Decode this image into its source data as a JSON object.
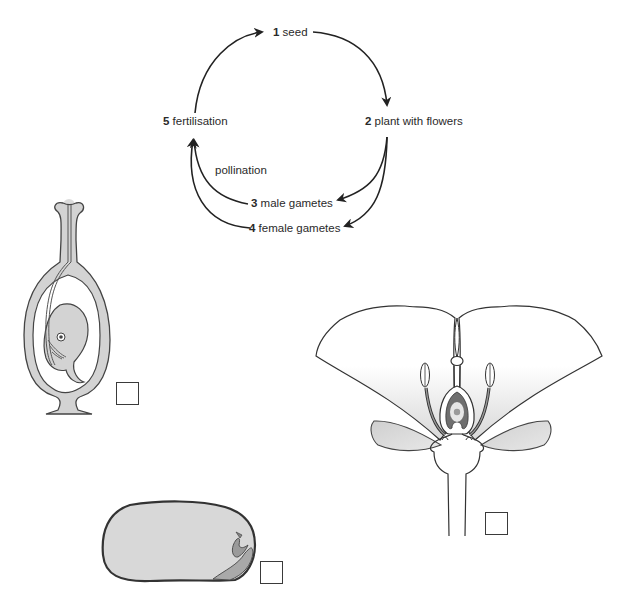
{
  "cycle": {
    "stages": [
      {
        "number": "1",
        "label": "seed"
      },
      {
        "number": "2",
        "label": "plant with flowers"
      },
      {
        "number": "3",
        "label": "male gametes"
      },
      {
        "number": "4",
        "label": "female gametes"
      },
      {
        "number": "5",
        "label": "fertilisation"
      }
    ],
    "arrow_labels": {
      "pollination": "pollination"
    }
  },
  "figures": [
    {
      "name": "pistil-ovary-section",
      "answer_box": ""
    },
    {
      "name": "flower-section",
      "answer_box": ""
    },
    {
      "name": "seed-section",
      "answer_box": ""
    }
  ],
  "colors": {
    "stroke": "#3a3a3a",
    "fill_grey": "#d6d6d6",
    "fill_light": "#e4e4e4",
    "background": "#ffffff"
  }
}
